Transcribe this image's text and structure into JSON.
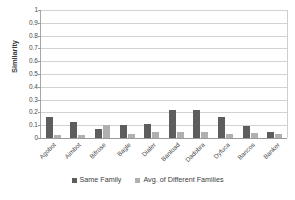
{
  "chart_data": {
    "type": "bar",
    "title": "",
    "xlabel": "",
    "ylabel": "Similarity",
    "ylim": [
      0,
      1
    ],
    "ytick_step": 0.1,
    "yticks": [
      "1",
      "0.9",
      "0.8",
      "0.7",
      "0.6",
      "0.5",
      "0.4",
      "0.3",
      "0.2",
      "0.1",
      "0"
    ],
    "grid": true,
    "legend_position": "bottom",
    "categories": [
      "Agobot",
      "Aimbot",
      "Bifrose",
      "Bagle",
      "Dialer",
      "Banload",
      "Dadobra",
      "Dyfuca",
      "Bancos",
      "Banker"
    ],
    "series": [
      {
        "name": "Same Family",
        "color": "#5d5d5d",
        "values": [
          0.165,
          0.125,
          0.07,
          0.1,
          0.11,
          0.215,
          0.215,
          0.165,
          0.095,
          0.045
        ]
      },
      {
        "name": "Avg. of Different Families",
        "color": "#b0b0b0",
        "values": [
          0.025,
          0.025,
          0.1,
          0.03,
          0.05,
          0.045,
          0.045,
          0.035,
          0.04,
          0.035
        ]
      }
    ]
  },
  "legend": {
    "items": [
      {
        "label": "Same Family",
        "marker": "square-marker-dark"
      },
      {
        "label": "Avg. of Different Families",
        "marker": "square-marker-light"
      }
    ]
  },
  "colors": {
    "same_family": "#5d5d5d",
    "different_families": "#b0b0b0",
    "gridline": "#d2d2d2",
    "axis": "#9a9a9a",
    "text": "#3d3d3d",
    "background": "#ffffff"
  }
}
